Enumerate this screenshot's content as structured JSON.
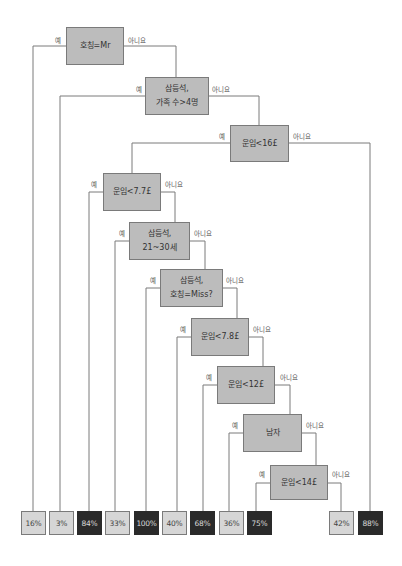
{
  "diagram": {
    "type": "decision-tree",
    "branch_labels": {
      "yes": "예",
      "no": "아니요"
    },
    "nodes": [
      {
        "id": "n1",
        "lines": [
          "호칭=Mr"
        ]
      },
      {
        "id": "n2",
        "lines": [
          "삼등석,",
          "가족 수>4명"
        ]
      },
      {
        "id": "n3",
        "lines": [
          "운임<16£"
        ]
      },
      {
        "id": "n4",
        "lines": [
          "운임<7.7£"
        ]
      },
      {
        "id": "n5",
        "lines": [
          "삼등석,",
          "21~30세"
        ]
      },
      {
        "id": "n6",
        "lines": [
          "삼등석,",
          "호칭=Miss?"
        ]
      },
      {
        "id": "n7",
        "lines": [
          "운임<7.8£"
        ]
      },
      {
        "id": "n8",
        "lines": [
          "운임<12£"
        ]
      },
      {
        "id": "n9",
        "lines": [
          "남자"
        ]
      },
      {
        "id": "n10",
        "lines": [
          "운임<14£"
        ]
      }
    ],
    "leaves": [
      {
        "id": "l1",
        "value": "16%",
        "style": "light",
        "parent": "n1",
        "branch": "yes"
      },
      {
        "id": "l2",
        "value": "3%",
        "style": "light",
        "parent": "n2",
        "branch": "yes"
      },
      {
        "id": "l3",
        "value": "84%",
        "style": "dark",
        "parent": "n4",
        "branch": "yes"
      },
      {
        "id": "l4",
        "value": "33%",
        "style": "light",
        "parent": "n5",
        "branch": "yes"
      },
      {
        "id": "l5",
        "value": "100%",
        "style": "dark",
        "parent": "n6",
        "branch": "yes"
      },
      {
        "id": "l6",
        "value": "40%",
        "style": "light",
        "parent": "n7",
        "branch": "yes"
      },
      {
        "id": "l7",
        "value": "68%",
        "style": "dark",
        "parent": "n8",
        "branch": "yes"
      },
      {
        "id": "l8",
        "value": "36%",
        "style": "light",
        "parent": "n9",
        "branch": "yes"
      },
      {
        "id": "l9",
        "value": "75%",
        "style": "dark",
        "parent": "n10",
        "branch": "yes"
      },
      {
        "id": "l10",
        "value": "42%",
        "style": "light",
        "parent": "n10",
        "branch": "no"
      },
      {
        "id": "l11",
        "value": "88%",
        "style": "dark",
        "parent": "n3",
        "branch": "no"
      }
    ],
    "colors": {
      "node_fill": "#bcbcbc",
      "leaf_light": "#d6d6d6",
      "leaf_dark": "#2a2a2a",
      "line": "#7a7a7a"
    }
  }
}
